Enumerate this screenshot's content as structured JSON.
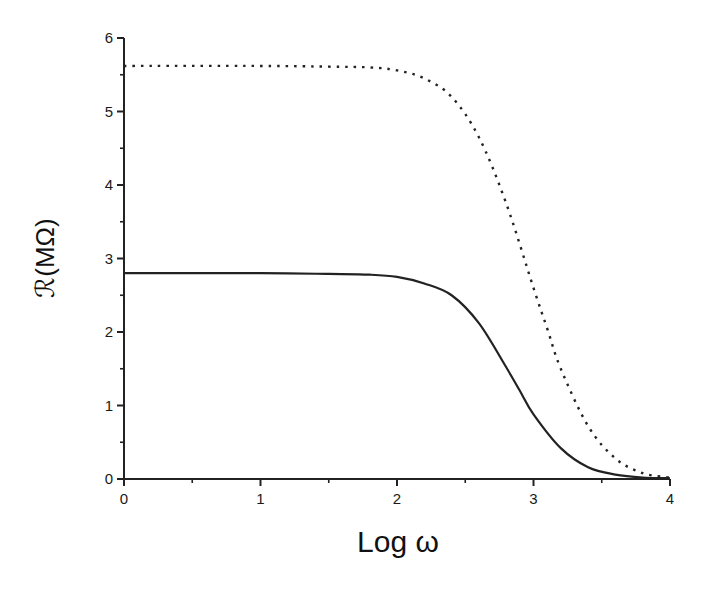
{
  "chart_data": {
    "type": "line",
    "title": "",
    "xlabel": "Log ω",
    "ylabel_script": "ℛ",
    "ylabel_unit": "(MΩ)",
    "ylabel": "ℛ(MΩ)",
    "xlim": [
      0,
      4
    ],
    "ylim": [
      0,
      6
    ],
    "x_ticks": [
      "0",
      "1",
      "2",
      "3",
      "4"
    ],
    "y_ticks": [
      "0",
      "1",
      "2",
      "3",
      "4",
      "5",
      "6"
    ],
    "grid": false,
    "legend": null,
    "series": [
      {
        "name": "solid",
        "style": "solid",
        "x": [
          0,
          1,
          1.5,
          1.8,
          2.0,
          2.2,
          2.4,
          2.6,
          2.8,
          2.9,
          3.0,
          3.2,
          3.4,
          3.6,
          3.8,
          4.0
        ],
        "values": [
          2.8,
          2.8,
          2.79,
          2.78,
          2.75,
          2.66,
          2.5,
          2.12,
          1.52,
          1.2,
          0.88,
          0.42,
          0.16,
          0.06,
          0.02,
          0.01
        ]
      },
      {
        "name": "dotted",
        "style": "dotted",
        "x": [
          0,
          1,
          1.5,
          1.8,
          2.0,
          2.2,
          2.4,
          2.6,
          2.8,
          3.0,
          3.1,
          3.2,
          3.4,
          3.6,
          3.8,
          4.0
        ],
        "values": [
          5.62,
          5.62,
          5.61,
          5.6,
          5.56,
          5.45,
          5.2,
          4.65,
          3.75,
          2.6,
          2.05,
          1.5,
          0.72,
          0.28,
          0.08,
          0.02
        ]
      }
    ]
  }
}
